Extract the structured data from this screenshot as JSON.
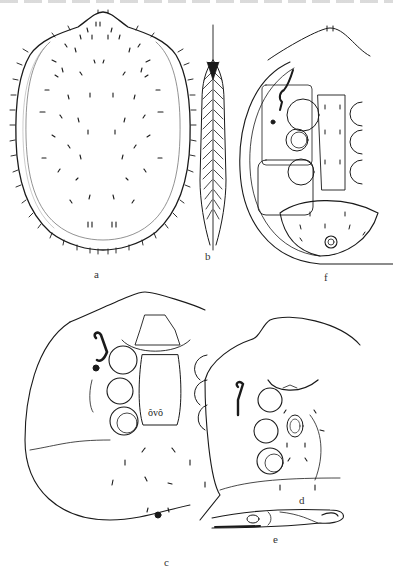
{
  "plate": {
    "description": "Mite morphology illustration plate",
    "panels": [
      {
        "id": "a",
        "label": "a",
        "content": "dorsal shield with setae"
      },
      {
        "id": "b",
        "label": "b",
        "content": "plumose seta"
      },
      {
        "id": "c",
        "label": "c",
        "content": "ventral view, idiosoma with legs coxae and genital region"
      },
      {
        "id": "d",
        "label": "d",
        "content": "ventral view, variant"
      },
      {
        "id": "e",
        "label": "e",
        "content": "chelicera / gnathosoma lateral"
      },
      {
        "id": "f",
        "label": "f",
        "content": "ventral view with ventrianal shield"
      }
    ]
  },
  "colors": {
    "ink": "#1a1a1a",
    "paper": "#ffffff"
  }
}
